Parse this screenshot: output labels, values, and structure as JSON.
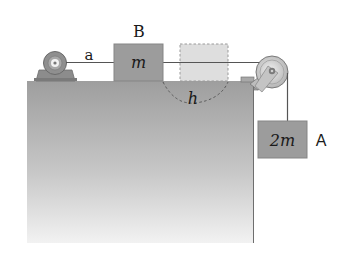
{
  "diagram": {
    "type": "physics-pulley-system",
    "labels": {
      "rope_segment": "a",
      "block_b": "B",
      "block_b_mass": "m",
      "displacement": "h",
      "block_a": "A",
      "block_a_mass": "2m"
    },
    "elements": {
      "table": "rectangular block support (gray gradient)",
      "motor": "motor/winch at left end of table",
      "block_b": "block on table connected to motor by rope a",
      "ghost_block": "dashed outline showing block B displaced by h",
      "pulley": "pulley at right corner of table",
      "block_a": "hanging block"
    },
    "colors": {
      "block_fill": "#9c9c9c",
      "block_stroke": "#8a8a8a",
      "ghost_fill": "#d6d6d6",
      "table_top": "#9a9a9a",
      "table_bottom": "#f0f0f0",
      "rope": "#555555",
      "text": "#1a1a1a"
    }
  }
}
